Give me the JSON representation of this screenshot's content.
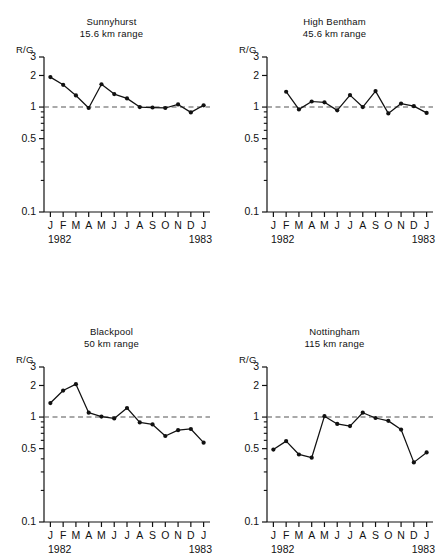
{
  "figure": {
    "panel_count": 4,
    "shared": {
      "ylabel": "R/G",
      "y_major_ticks": [
        "3",
        "2",
        "1",
        "0.5",
        "0.1"
      ],
      "y_major_values": [
        3,
        2,
        1,
        0.5,
        0.1
      ],
      "y_minor_values": [
        0.9,
        0.8,
        0.7,
        0.6,
        0.4,
        0.3,
        0.2
      ],
      "x_tick_labels": [
        "J",
        "F",
        "M",
        "A",
        "M",
        "J",
        "J",
        "A",
        "S",
        "O",
        "N",
        "D",
        "J"
      ],
      "year_start": "1982",
      "year_end": "1983",
      "reference_line_value": 1,
      "line_color": "#111111",
      "marker_color": "#111111",
      "reference_line_color": "#555555",
      "axis_color": "#111111"
    }
  },
  "chart_data": [
    {
      "type": "line",
      "title": "Sunnyhurst",
      "subtitle": "15.6 km range",
      "station": "Sunnyhurst",
      "range_km": 15.6,
      "panel_position": "top-left",
      "xlabel": "",
      "ylabel": "R/G",
      "yscale": "log",
      "ylim": [
        0.1,
        3
      ],
      "grid": false,
      "reference_line": 1,
      "x": [
        "J",
        "F",
        "M",
        "A",
        "M",
        "J",
        "J",
        "A",
        "S",
        "O",
        "N",
        "D",
        "J"
      ],
      "months": [
        "Jan 1982",
        "Feb 1982",
        "Mar 1982",
        "Apr 1982",
        "May 1982",
        "Jun 1982",
        "Jul 1982",
        "Aug 1982",
        "Sep 1982",
        "Oct 1982",
        "Nov 1982",
        "Dec 1982",
        "Jan 1983"
      ],
      "values": [
        1.93,
        1.63,
        1.29,
        0.98,
        1.65,
        1.33,
        1.21,
        1.0,
        0.99,
        0.98,
        1.06,
        0.89,
        1.04
      ]
    },
    {
      "type": "line",
      "title": "High Bentham",
      "subtitle": "45.6 km range",
      "station": "High Bentham",
      "range_km": 45.6,
      "panel_position": "top-right",
      "xlabel": "",
      "ylabel": "R/G",
      "yscale": "log",
      "ylim": [
        0.1,
        3
      ],
      "grid": false,
      "reference_line": 1,
      "x": [
        "J",
        "F",
        "M",
        "A",
        "M",
        "J",
        "J",
        "A",
        "S",
        "O",
        "N",
        "D",
        "J"
      ],
      "months": [
        "Jan 1982",
        "Feb 1982",
        "Mar 1982",
        "Apr 1982",
        "May 1982",
        "Jun 1982",
        "Jul 1982",
        "Aug 1982",
        "Sep 1982",
        "Oct 1982",
        "Nov 1982",
        "Dec 1982",
        "Jan 1983"
      ],
      "values": [
        null,
        1.4,
        0.95,
        1.13,
        1.11,
        0.93,
        1.3,
        1.0,
        1.42,
        0.87,
        1.08,
        1.02,
        0.88
      ]
    },
    {
      "type": "line",
      "title": "Blackpool",
      "subtitle": "50 km range",
      "station": "Blackpool",
      "range_km": 50,
      "panel_position": "bottom-left",
      "xlabel": "",
      "ylabel": "R/G",
      "yscale": "log",
      "ylim": [
        0.1,
        3
      ],
      "grid": false,
      "reference_line": 1,
      "x": [
        "J",
        "F",
        "M",
        "A",
        "M",
        "J",
        "J",
        "A",
        "S",
        "O",
        "N",
        "D",
        "J"
      ],
      "months": [
        "Jan 1982",
        "Feb 1982",
        "Mar 1982",
        "Apr 1982",
        "May 1982",
        "Jun 1982",
        "Jul 1982",
        "Aug 1982",
        "Sep 1982",
        "Oct 1982",
        "Nov 1982",
        "Dec 1982",
        "Jan 1983"
      ],
      "values": [
        1.36,
        1.79,
        2.06,
        1.1,
        1.01,
        0.97,
        1.22,
        0.89,
        0.85,
        0.66,
        0.75,
        0.77,
        0.57
      ]
    },
    {
      "type": "line",
      "title": "Nottingham",
      "subtitle": "115 km range",
      "station": "Nottingham",
      "range_km": 115,
      "panel_position": "bottom-right",
      "xlabel": "",
      "ylabel": "R/G",
      "yscale": "log",
      "ylim": [
        0.1,
        3
      ],
      "grid": false,
      "reference_line": 1,
      "x": [
        "J",
        "F",
        "M",
        "A",
        "M",
        "J",
        "J",
        "A",
        "S",
        "O",
        "N",
        "D",
        "J"
      ],
      "months": [
        "Jan 1982",
        "Feb 1982",
        "Mar 1982",
        "Apr 1982",
        "May 1982",
        "Jun 1982",
        "Jul 1982",
        "Aug 1982",
        "Sep 1982",
        "Oct 1982",
        "Nov 1982",
        "Dec 1982",
        "Jan 1983"
      ],
      "values": [
        0.49,
        0.59,
        0.44,
        0.41,
        1.02,
        0.86,
        0.82,
        1.1,
        0.98,
        0.92,
        0.76,
        0.37,
        0.46
      ]
    }
  ]
}
